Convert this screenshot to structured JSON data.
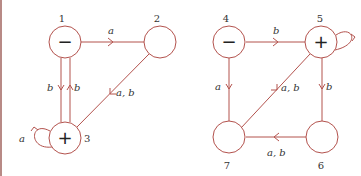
{
  "colors": {
    "stroke": "#b3524d",
    "text": "#333333",
    "border": "#b88a86"
  },
  "left_automaton": {
    "nodes": [
      {
        "id": "1",
        "label": "1",
        "mark": "−",
        "role": "initial"
      },
      {
        "id": "2",
        "label": "2",
        "mark": ""
      },
      {
        "id": "3",
        "label": "3",
        "mark": "+",
        "role": "final"
      }
    ],
    "edges": [
      {
        "from": "1",
        "to": "2",
        "label": "a"
      },
      {
        "from": "1",
        "to": "3",
        "label": "b"
      },
      {
        "from": "3",
        "to": "1",
        "label": "b"
      },
      {
        "from": "2",
        "to": "3",
        "label": "a, b"
      },
      {
        "from": "3",
        "to": "3",
        "label": "a"
      }
    ]
  },
  "right_automaton": {
    "nodes": [
      {
        "id": "4",
        "label": "4",
        "mark": "−",
        "role": "initial"
      },
      {
        "id": "5",
        "label": "5",
        "mark": "+",
        "role": "final"
      },
      {
        "id": "6",
        "label": "6",
        "mark": ""
      },
      {
        "id": "7",
        "label": "7",
        "mark": ""
      }
    ],
    "edges": [
      {
        "from": "4",
        "to": "5",
        "label": "b"
      },
      {
        "from": "4",
        "to": "7",
        "label": "a"
      },
      {
        "from": "5",
        "to": "6",
        "label": "b"
      },
      {
        "from": "7",
        "to": "5",
        "label": "a, b"
      },
      {
        "from": "6",
        "to": "7",
        "label": "a, b"
      },
      {
        "from": "5",
        "to": "5",
        "label": ""
      }
    ]
  }
}
